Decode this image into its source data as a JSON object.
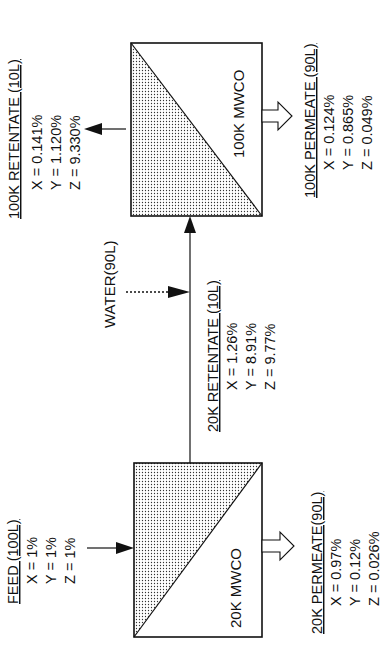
{
  "diagram": {
    "orientation": "rotated-90-ccw",
    "membranes": [
      {
        "id": "m100k",
        "label": "100K MWCO"
      },
      {
        "id": "m20k",
        "label": "20K MWCO"
      }
    ],
    "streams": {
      "feed": {
        "title": "FEED (100L)",
        "x": "X = 1%",
        "y": "Y = 1%",
        "z": "Z = 1%"
      },
      "permeate_20k": {
        "title": "20K PERMEATE(90L)",
        "x": "X = 0.97%",
        "y": "Y = 0.12%",
        "z": "Z = 0.026%"
      },
      "retentate_20k": {
        "title": "20K RETENTATE (10L)",
        "x": "X = 1.26%",
        "y": "Y = 8.91%",
        "z": "Z = 9.77%"
      },
      "water": {
        "title": "WATER(90L)"
      },
      "retentate_100k": {
        "title": "100K RETENTATE (10L)",
        "x": "X = 0.141%",
        "y": "Y = 1.120%",
        "z": "Z = 9.330%"
      },
      "permeate_100k": {
        "title": "100K PERMEATE (90L)",
        "x": "X = 0.124%",
        "y": "Y = 0.865%",
        "z": "Z = 0.049%"
      }
    },
    "colors": {
      "line": "#111111",
      "background": "#ffffff",
      "stipple": "#333333"
    }
  }
}
